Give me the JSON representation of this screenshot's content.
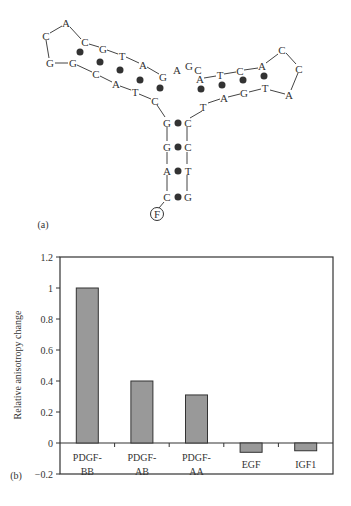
{
  "panel_a": {
    "label": "(a)",
    "fluorophore": "F",
    "left_hairpin": {
      "loop": [
        "C",
        "A",
        "C",
        "G",
        "G"
      ],
      "top_strand": [
        "C",
        "G",
        "T",
        "A",
        "G"
      ],
      "bottom_strand": [
        "G",
        "C",
        "A",
        "T",
        "C"
      ]
    },
    "junction": [
      "A",
      "G",
      "C"
    ],
    "right_hairpin": {
      "top_strand": [
        "A",
        "T",
        "C",
        "A"
      ],
      "loop": [
        "C",
        "C",
        "A"
      ],
      "bottom_strand": [
        "T",
        "A",
        "G",
        "T"
      ]
    },
    "stem": {
      "left": [
        "G",
        "G",
        "A",
        "C"
      ],
      "right": [
        "C",
        "C",
        "T",
        "G"
      ]
    }
  },
  "panel_b": {
    "label": "(b)"
  },
  "chart_data": {
    "type": "bar",
    "title": "",
    "categories": [
      "PDGF-BB",
      "PDGF-AB",
      "PDGF-AA",
      "EGF",
      "IGF1"
    ],
    "category_lines": [
      [
        "PDGF-",
        "BB"
      ],
      [
        "PDGF-",
        "AB"
      ],
      [
        "PDGF-",
        "AA"
      ],
      [
        "EGF"
      ],
      [
        "IGF1"
      ]
    ],
    "values": [
      1.0,
      0.4,
      0.31,
      -0.06,
      -0.05
    ],
    "xlabel": "",
    "ylabel": "Relative anisotropy change",
    "ylim": [
      -0.2,
      1.2
    ],
    "yticks": [
      -0.2,
      0,
      0.2,
      0.4,
      0.6,
      0.8,
      1,
      1.2
    ],
    "ytick_labels": [
      "−0.2",
      "0",
      "0.2",
      "0.4",
      "0.6",
      "0.8",
      "1",
      "1.2"
    ],
    "grid": false,
    "legend": "none",
    "bar_color": "#999999",
    "bar_edge": "#333333"
  }
}
